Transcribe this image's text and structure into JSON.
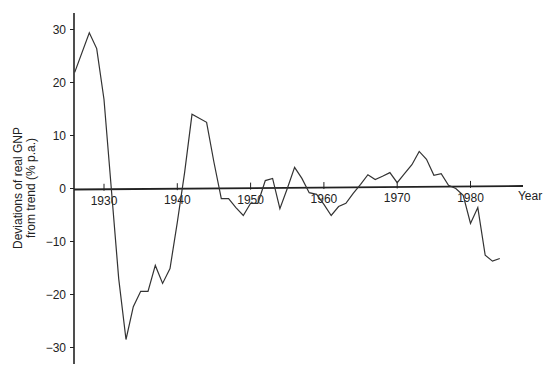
{
  "chart_data": {
    "type": "line",
    "title": "",
    "xlabel": "Year",
    "ylabel": "Deviations of real GNP from trend (% p.a.)",
    "ylabel_lines": [
      "Deviations of real GNP",
      "from trend (% p.a.)"
    ],
    "xlim": [
      1926,
      1984
    ],
    "ylim": [
      -33,
      33
    ],
    "grid": false,
    "legend": null,
    "x_ticks": [
      1930,
      1940,
      1950,
      1960,
      1970,
      1980
    ],
    "x_tick_labels": [
      "1930",
      "1940",
      "1950",
      "1960",
      "1970",
      "1980"
    ],
    "y_ticks": [
      30,
      20,
      10,
      0,
      -10,
      -20,
      -30
    ],
    "y_tick_labels": [
      "30",
      "20",
      "10",
      "0",
      "−10",
      "−20",
      "−30"
    ],
    "series": [
      {
        "name": "Deviations of real GNP from trend",
        "color": "#333333",
        "x": [
          1926,
          1928,
          1929,
          1930,
          1931,
          1932,
          1933,
          1934,
          1935,
          1936,
          1937,
          1938,
          1939,
          1940,
          1941,
          1942,
          1944,
          1945,
          1946,
          1947,
          1948,
          1949,
          1950,
          1951,
          1952,
          1953,
          1954,
          1955,
          1956,
          1957,
          1958,
          1959,
          1960,
          1961,
          1962,
          1963,
          1964,
          1965,
          1966,
          1967,
          1968,
          1969,
          1970,
          1971,
          1972,
          1973,
          1974,
          1975,
          1976,
          1977,
          1978,
          1979,
          1980,
          1981,
          1982,
          1983,
          1984
        ],
        "values": [
          21.9,
          29.4,
          26.4,
          16.8,
          0,
          -17,
          -28.5,
          -22.3,
          -19.4,
          -19.4,
          -14.5,
          -17.9,
          -15.1,
          -6.4,
          3,
          14.0,
          12.5,
          5,
          -1.9,
          -1.9,
          -3.6,
          -5.1,
          -2.8,
          -2.8,
          1.5,
          1.9,
          -3.8,
          0,
          4.0,
          1.9,
          -0.8,
          -1.1,
          -3.0,
          -5.1,
          -3.4,
          -2.8,
          -0.9,
          0.8,
          2.6,
          1.7,
          2.3,
          3.0,
          1.1,
          2.8,
          4.5,
          7.0,
          5.5,
          2.5,
          2.8,
          0.6,
          0,
          -1.3,
          -6.6,
          -3.6,
          -12.6,
          -13.7,
          -13.2
        ]
      }
    ]
  }
}
